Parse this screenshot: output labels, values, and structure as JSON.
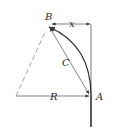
{
  "diagram": {
    "title": "",
    "labels": {
      "B": "B",
      "A": "A",
      "x": "x",
      "C": "C",
      "R": "R"
    },
    "colors": {
      "stroke": "#3a3a3a",
      "dashed": "#8a8a8a",
      "thin": "#666666",
      "background": "#ffffff"
    },
    "elements": [
      {
        "id": "vertical-line",
        "description": "vertical line through A extending to bottom"
      },
      {
        "id": "arc-AB",
        "description": "curved arc from A up to B"
      },
      {
        "id": "chord-C",
        "description": "double-headed arrow from B to A labeled C"
      },
      {
        "id": "radius-R",
        "description": "horizontal arrow from center to A labeled R"
      },
      {
        "id": "radius-dashed",
        "description": "dashed line from center to B"
      },
      {
        "id": "offset-x",
        "description": "horizontal dimension from B to vertical line labeled x"
      }
    ]
  }
}
